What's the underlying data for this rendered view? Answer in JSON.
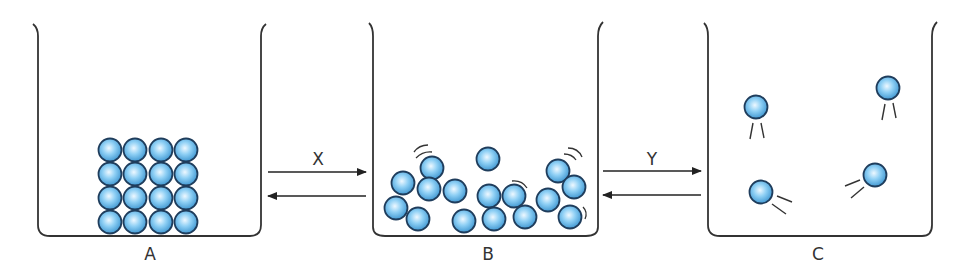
{
  "diagram": {
    "type": "states-of-matter-transitions",
    "containers": [
      {
        "id": "A",
        "label": "A",
        "state": "solid",
        "particles": 16
      },
      {
        "id": "B",
        "label": "B",
        "state": "liquid",
        "particles": 16
      },
      {
        "id": "C",
        "label": "C",
        "state": "gas",
        "particles": 4
      }
    ],
    "transitions": [
      {
        "label": "X",
        "from": "A",
        "to": "B",
        "reversible": true
      },
      {
        "label": "Y",
        "from": "B",
        "to": "C",
        "reversible": true
      }
    ],
    "colors": {
      "particle_fill": "#5eb4e6",
      "particle_highlight": "#e8f6ff",
      "particle_outline": "#1f3d5c",
      "line": "#333333"
    }
  }
}
